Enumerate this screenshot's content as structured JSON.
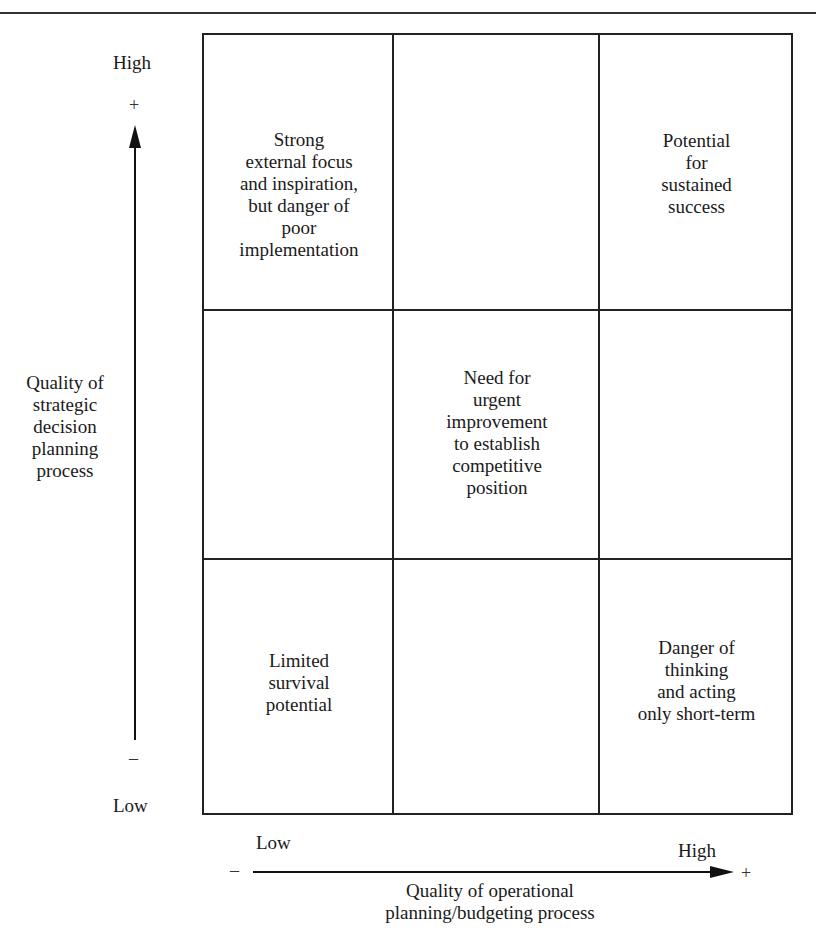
{
  "figure": {
    "header_fragment": "...RS LEADER",
    "y_axis": {
      "label_lines": [
        "Quality of",
        "strategic",
        "decision",
        "planning",
        "process"
      ],
      "high_label": "High",
      "low_label": "Low",
      "plus_sign": "+",
      "minus_sign": "–"
    },
    "x_axis": {
      "label_lines": [
        "Quality of operational",
        "planning/budgeting process"
      ],
      "high_label": "High",
      "low_label": "Low",
      "plus_sign": "+",
      "minus_sign": "–"
    },
    "cells": {
      "top_left": [
        "Strong",
        "external focus",
        "and inspiration,",
        "but danger of",
        "poor",
        "implementation"
      ],
      "top_center": [],
      "top_right": [
        "Potential",
        "for",
        "sustained",
        "success"
      ],
      "middle_left": [],
      "middle_center": [
        "Need for",
        "urgent",
        "improvement",
        "to establish",
        "competitive",
        "position"
      ],
      "middle_right": [],
      "bottom_left": [
        "Limited",
        "survival",
        "potential"
      ],
      "bottom_center": [],
      "bottom_right": [
        "Danger of",
        "thinking",
        "and acting",
        "only short-term"
      ]
    },
    "colors": {
      "ink": "#1a1a1a",
      "background": "#ffffff"
    }
  }
}
